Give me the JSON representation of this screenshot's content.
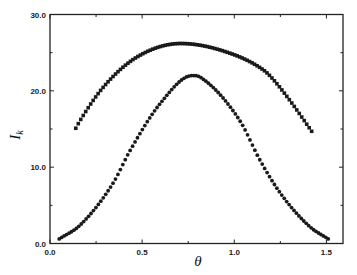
{
  "chart_data": {
    "type": "scatter",
    "title": "",
    "xlabel": "θ",
    "ylabel": "I",
    "ylabel_subscript": "k",
    "xlim": [
      0.0,
      1.59
    ],
    "ylim": [
      0.0,
      30.0
    ],
    "xticks": [
      0.0,
      0.5,
      1.0,
      1.5
    ],
    "xtick_labels": [
      "0.0",
      "0.5",
      "1.0",
      "1.5"
    ],
    "yticks": [
      0.0,
      10.0,
      20.0,
      30.0
    ],
    "ytick_labels": [
      "0.0",
      "10.0",
      "20.0",
      "30.0"
    ],
    "grid": false,
    "legend": "none",
    "series": [
      {
        "name": "upper",
        "marker": "square",
        "color": "#1a1a1a",
        "x": [
          0.14,
          0.163,
          0.29,
          0.47,
          0.71,
          0.98,
          1.16,
          1.2,
          1.3,
          1.42
        ],
        "y": [
          15.1,
          16.1,
          20.5,
          24.4,
          26.2,
          24.9,
          22.7,
          21.8,
          18.8,
          14.7
        ]
      },
      {
        "name": "lower",
        "marker": "circle",
        "color": "#1a1a1a",
        "x": [
          0.05,
          0.163,
          0.342,
          0.435,
          0.6,
          0.772,
          0.815,
          1.03,
          1.14,
          1.25,
          1.41,
          1.51
        ],
        "y": [
          0.6,
          2.4,
          7.9,
          12.2,
          18.4,
          22.0,
          21.8,
          16.1,
          10.9,
          6.6,
          2.2,
          0.6
        ]
      }
    ]
  }
}
